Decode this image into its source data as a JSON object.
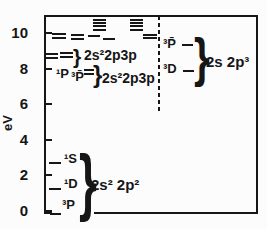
{
  "ui": {
    "brace_glyph": "}"
  },
  "chart_data": {
    "type": "line",
    "subtype": "energy-level-diagram",
    "title": "",
    "ylabel": "eV",
    "ylim": [
      0,
      11.1
    ],
    "yticks": [
      0,
      2,
      4,
      6,
      8,
      10
    ],
    "grid": false,
    "dashed_divider": true,
    "level_groups": [
      {
        "id": "ground-2s2-2p2",
        "label": "2s² 2p²",
        "levels": [
          {
            "term": "³P",
            "eV": 0.0,
            "x": 50,
            "w": 11,
            "dy": 2
          },
          {
            "term": "¹D",
            "eV": 1.3,
            "x": 49,
            "w": 12
          },
          {
            "term": "¹S",
            "eV": 2.75,
            "x": 49,
            "w": 12
          }
        ]
      },
      {
        "id": "lower-2s2-2p3p",
        "label": "2s²2p3p",
        "terms": [
          "¹P",
          "³P̄"
        ],
        "levels": [
          {
            "eV": 7.75,
            "x": 84,
            "w": 10
          },
          {
            "eV": 8.0,
            "x": 84,
            "w": 10
          }
        ]
      },
      {
        "id": "upper-2s2-2p3p",
        "label": "2s²2p3p",
        "levels": [
          {
            "eV": 8.65,
            "x": 46,
            "w": 12
          },
          {
            "eV": 8.9,
            "x": 46,
            "w": 12
          },
          {
            "eV": 8.7,
            "x": 60,
            "w": 13
          },
          {
            "eV": 8.95,
            "x": 60,
            "w": 13
          }
        ]
      },
      {
        "id": "right-2s-2p3",
        "label": "2s 2p³",
        "levels": [
          {
            "term": "³D",
            "eV": 7.9,
            "x": 183,
            "w": 11
          },
          {
            "term": "³P̄",
            "eV": 9.4,
            "x": 182,
            "w": 11
          }
        ]
      },
      {
        "id": "unlabeled-left-pairs",
        "levels": [
          {
            "eV": 9.78,
            "x": 52,
            "w": 14
          },
          {
            "eV": 10.0,
            "x": 52,
            "w": 14
          },
          {
            "eV": 9.72,
            "x": 71,
            "w": 13
          },
          {
            "eV": 9.95,
            "x": 71,
            "w": 13
          }
        ]
      },
      {
        "id": "cluster-1",
        "levels": [
          {
            "eV": 10.25,
            "x": 93,
            "w": 13
          },
          {
            "eV": 10.45,
            "x": 93,
            "w": 13
          },
          {
            "eV": 10.62,
            "x": 93,
            "w": 13
          },
          {
            "eV": 10.8,
            "x": 93,
            "w": 13
          }
        ]
      },
      {
        "id": "cluster-2",
        "levels": [
          {
            "eV": 10.25,
            "x": 130,
            "w": 13
          },
          {
            "eV": 10.45,
            "x": 130,
            "w": 13
          },
          {
            "eV": 10.62,
            "x": 130,
            "w": 13
          },
          {
            "eV": 10.8,
            "x": 130,
            "w": 13
          }
        ]
      },
      {
        "id": "below-cluster-1",
        "levels": [
          {
            "eV": 9.88,
            "x": 88,
            "w": 12
          },
          {
            "eV": 9.72,
            "x": 103,
            "w": 12
          }
        ]
      },
      {
        "id": "below-cluster-2",
        "levels": [
          {
            "eV": 9.95,
            "x": 143,
            "w": 14
          },
          {
            "eV": 9.78,
            "x": 143,
            "w": 14
          }
        ]
      }
    ]
  }
}
